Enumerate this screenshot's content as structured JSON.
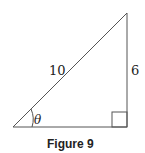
{
  "figure": {
    "caption": "Figure 9",
    "hypotenuse_label": "10",
    "opposite_label": "6",
    "angle_label": "θ",
    "right_angle_marker": true,
    "line_color": "#555555"
  }
}
